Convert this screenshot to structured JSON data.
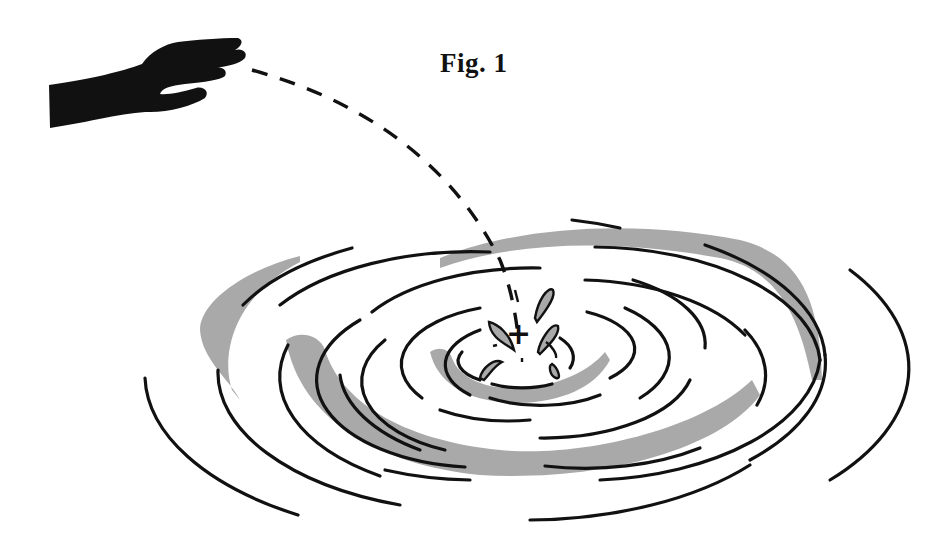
{
  "figure": {
    "title": "Fig. 1"
  },
  "colors": {
    "ink": "#111111",
    "shading": "#a9a9a9",
    "background": "#ffffff"
  },
  "elements": {
    "hand": "hand silhouette",
    "trajectory": "dashed arc",
    "impact_marker": "+",
    "ripples": "concentric elliptical arcs",
    "splash": "droplets"
  }
}
